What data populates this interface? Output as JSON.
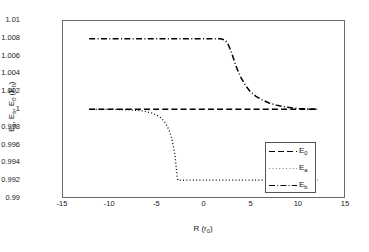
{
  "figure": {
    "background_color": "#ffffff",
    "axis_color": "#6a6a6a",
    "line_color": "#000000"
  },
  "axes": {
    "xlabel_main": "R (r",
    "xlabel_sub": "0",
    "xlabel_tail": ")",
    "ylabel_text": "E",
    "ylabel_sub_a": "a",
    "ylabel_sep1": ", E",
    "ylabel_sub_b": "b",
    "ylabel_sep2": ", E",
    "ylabel_sub_0": "0",
    "ylabel_unit_open": " (E",
    "ylabel_unit_sub": "0",
    "ylabel_unit_close": ")",
    "xticks": [
      "-15",
      "-10",
      "-5",
      "0",
      "5",
      "10",
      "15"
    ],
    "yticks": [
      "1.01",
      "1.008",
      "1.006",
      "1.004",
      "1.002",
      "1",
      "0.998",
      "0.996",
      "0.994",
      "0.992",
      "0.99"
    ]
  },
  "legend": {
    "position": "inside-lower-right",
    "entries": [
      {
        "label_base": "E",
        "label_sub": "0",
        "style": "dashed"
      },
      {
        "label_base": "E",
        "label_sub": "a",
        "style": "dotted"
      },
      {
        "label_base": "E",
        "label_sub": "b",
        "style": "dashdot"
      }
    ]
  },
  "chart_data": {
    "type": "line",
    "title": "",
    "xlabel": "R (r_0)",
    "ylabel": "E_a, E_b, E_0 (E_0)",
    "xlim": [
      -15,
      15
    ],
    "ylim": [
      0.99,
      1.01
    ],
    "xticks": [
      -15,
      -10,
      -5,
      0,
      5,
      10,
      15
    ],
    "yticks": [
      0.99,
      0.992,
      0.994,
      0.996,
      0.998,
      1.0,
      1.002,
      1.004,
      1.006,
      1.008,
      1.01
    ],
    "grid": false,
    "legend_position": "lower right inside",
    "series": [
      {
        "name": "E_0",
        "style": "dashed",
        "color": "#000000",
        "x": [
          -12.2,
          -10,
          -8,
          -6,
          -4,
          -2,
          0,
          2,
          4,
          6,
          8,
          10,
          12.2
        ],
        "y": [
          1.0,
          1.0,
          1.0,
          1.0,
          1.0,
          1.0,
          1.0,
          1.0,
          1.0,
          1.0,
          1.0,
          1.0,
          1.0
        ]
      },
      {
        "name": "E_a",
        "style": "dotted",
        "color": "#000000",
        "x": [
          -12.2,
          -11,
          -10,
          -9,
          -8,
          -7,
          -6.5,
          -6,
          -5.5,
          -5,
          -4.6,
          -4.2,
          -3.9,
          -3.6,
          -3.4,
          -3.2,
          -3.05,
          -2.95,
          -2.9,
          -2.85,
          -2.8,
          -2.75,
          -2.7,
          -2.6,
          -2.4,
          -2.0,
          -1.0,
          0,
          2,
          4,
          6,
          8,
          10,
          12.2
        ],
        "y": [
          1.0,
          1.0,
          1.0,
          0.99998,
          0.99995,
          0.99988,
          0.99982,
          0.99972,
          0.99958,
          0.99935,
          0.99908,
          0.99865,
          0.99815,
          0.99745,
          0.99675,
          0.99575,
          0.9948,
          0.9939,
          0.9933,
          0.99275,
          0.9923,
          0.992,
          0.992,
          0.992,
          0.992,
          0.992,
          0.992,
          0.992,
          0.992,
          0.992,
          0.992,
          0.992,
          0.992,
          0.992
        ]
      },
      {
        "name": "E_b",
        "style": "dashdot",
        "color": "#000000",
        "x": [
          -12.2,
          -10,
          -8,
          -6,
          -4,
          -2,
          0,
          1.2,
          1.8,
          2.1,
          2.4,
          2.6,
          2.8,
          3.0,
          3.3,
          3.6,
          4.0,
          4.5,
          5.0,
          5.6,
          6.2,
          7.0,
          7.8,
          8.6,
          9.4,
          10.2,
          11.2,
          12.2
        ],
        "y": [
          1.008,
          1.008,
          1.008,
          1.008,
          1.008,
          1.008,
          1.008,
          1.008,
          1.00798,
          1.0079,
          1.0077,
          1.0074,
          1.00695,
          1.0064,
          1.00545,
          1.00455,
          1.0036,
          1.00268,
          1.002,
          1.00148,
          1.0011,
          1.00072,
          1.00048,
          1.0003,
          1.00018,
          1.0001,
          1.00004,
          1.0
        ]
      }
    ]
  }
}
